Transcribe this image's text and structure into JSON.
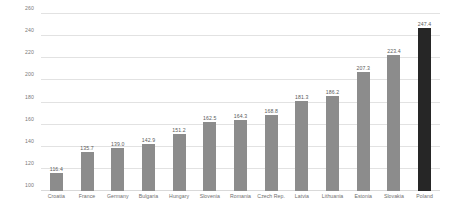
{
  "chart_data": {
    "type": "bar",
    "title": "",
    "subtitle": "",
    "xlabel": "",
    "ylabel": "",
    "ylim": [
      100,
      260
    ],
    "ytick_step": 20,
    "yticks": [
      100,
      120,
      140,
      160,
      180,
      200,
      220,
      240,
      260
    ],
    "grid": true,
    "legend": false,
    "legend_position": "none",
    "categories": [
      "Croatia",
      "France",
      "Germany",
      "Bulgaria",
      "Hungary",
      "Slovenia",
      "Romania",
      "Czech Rep.",
      "Latvia",
      "Lithuania",
      "Estonia",
      "Slovakia",
      "Poland"
    ],
    "values": [
      116.4,
      135.7,
      139.0,
      142.9,
      151.2,
      162.5,
      164.3,
      168.8,
      181.3,
      186.2,
      207.3,
      223.4,
      247.4
    ],
    "value_labels": [
      "116.4",
      "135.7",
      "139.0",
      "142.9",
      "151.2",
      "162.5",
      "164.3",
      "168.8",
      "181.3",
      "186.2",
      "207.3",
      "223.4",
      "247.4"
    ],
    "bar_colors": [
      "#8c8c8c",
      "#8c8c8c",
      "#8c8c8c",
      "#8c8c8c",
      "#8c8c8c",
      "#8c8c8c",
      "#8c8c8c",
      "#8c8c8c",
      "#8c8c8c",
      "#8c8c8c",
      "#8c8c8c",
      "#8c8c8c",
      "#262626"
    ],
    "highlight_index": 12,
    "colors": {
      "bar_default": "#8c8c8c",
      "bar_highlight": "#262626",
      "gridline": "#e2e2e2",
      "axis_text": "#7a7a7a",
      "label_text": "#5b5b5b",
      "background": "#ffffff"
    }
  }
}
